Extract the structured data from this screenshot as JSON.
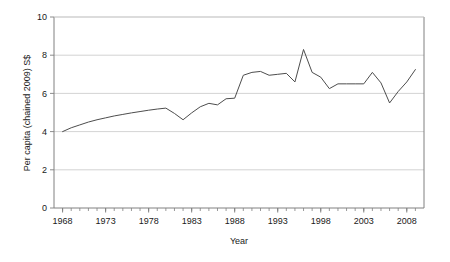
{
  "chart_data": {
    "type": "line",
    "title": "",
    "xlabel": "Year",
    "ylabel": "Per capita (chained 2009) S$",
    "xlim": [
      1967,
      2010
    ],
    "ylim": [
      0,
      10
    ],
    "ytick_values": [
      0,
      2,
      4,
      6,
      8,
      10
    ],
    "ytick_labels": [
      "0",
      "2",
      "4",
      "6",
      "8",
      "10"
    ],
    "xtick_labels": [
      "1968",
      "1973",
      "1978",
      "1983",
      "1988",
      "1993",
      "1998",
      "2003",
      "2008"
    ],
    "xtick_label_values": [
      1968,
      1973,
      1978,
      1983,
      1988,
      1993,
      1998,
      2003,
      2008
    ],
    "xtick_minor_values": [
      1968,
      1969,
      1970,
      1971,
      1972,
      1973,
      1974,
      1975,
      1976,
      1977,
      1978,
      1979,
      1980,
      1981,
      1982,
      1983,
      1984,
      1985,
      1986,
      1987,
      1988,
      1989,
      1990,
      1991,
      1992,
      1993,
      1994,
      1995,
      1996,
      1997,
      1998,
      1999,
      2000,
      2001,
      2002,
      2003,
      2004,
      2005,
      2006,
      2007,
      2008,
      2009
    ],
    "grid": "horizontal",
    "legend": "none",
    "line_color": "#4d4d4d",
    "grid_color": "#c8c8c8",
    "axis_color": "#808080",
    "series": [
      {
        "name": "Per capita consumption",
        "x": [
          1968,
          1969,
          1970,
          1971,
          1972,
          1973,
          1974,
          1975,
          1976,
          1977,
          1978,
          1979,
          1980,
          1981,
          1982,
          1983,
          1984,
          1985,
          1986,
          1987,
          1988,
          1989,
          1990,
          1991,
          1992,
          1993,
          1994,
          1995,
          1996,
          1997,
          1998,
          1999,
          2000,
          2001,
          2002,
          2003,
          2004,
          2005,
          2006,
          2007,
          2008,
          2009
        ],
        "values": [
          4.0,
          4.2,
          4.35,
          4.5,
          4.62,
          4.72,
          4.82,
          4.9,
          4.98,
          5.05,
          5.12,
          5.18,
          5.23,
          4.95,
          4.62,
          4.98,
          5.3,
          5.48,
          5.4,
          5.72,
          5.75,
          6.95,
          7.1,
          7.15,
          6.95,
          7.0,
          7.05,
          6.6,
          8.3,
          7.1,
          6.85,
          6.25,
          6.5,
          6.5,
          6.5,
          6.5,
          7.1,
          6.55,
          5.5,
          6.1,
          6.6,
          7.25
        ]
      }
    ]
  },
  "axis": {
    "ylabel": "Per capita (chained 2009) S$",
    "xlabel": "Year"
  }
}
